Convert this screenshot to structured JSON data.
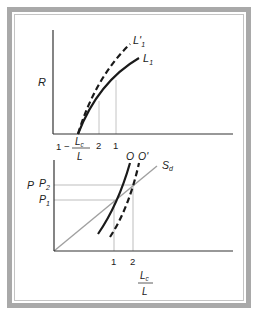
{
  "upper_panel": {
    "y_axis_label": "R",
    "x_axis_label": {
      "prefix": "1 −",
      "numerator": "L",
      "numerator_sub": "c",
      "denominator": "L"
    },
    "x_ticks": [
      "2",
      "1"
    ],
    "curves": [
      {
        "name": "L'",
        "sub": "1",
        "style": "dashed"
      },
      {
        "name": "L",
        "sub": "1",
        "style": "solid"
      }
    ]
  },
  "lower_panel": {
    "y_axis_label": "P",
    "y_ticks": [
      {
        "name": "P",
        "sub": "2"
      },
      {
        "name": "P",
        "sub": "1"
      }
    ],
    "x_ticks": [
      "1",
      "2"
    ],
    "x_axis_label": {
      "numerator": "L",
      "numerator_sub": "c",
      "denominator": "L"
    },
    "curves": [
      {
        "name": "O",
        "style": "solid"
      },
      {
        "name": "O'",
        "style": "dashed"
      },
      {
        "name": "S",
        "sub": "d",
        "style": "solid-gray"
      }
    ]
  },
  "colors": {
    "frame": "#a9a9a9",
    "axis": "#333333",
    "curve": "#1a1a1a",
    "guide": "#bdbdbd",
    "supply": "#a0a0a0"
  }
}
